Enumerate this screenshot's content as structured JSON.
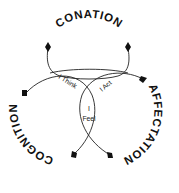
{
  "diagram": {
    "outer_labels": {
      "top": "CONATION",
      "right": "AFFECTATION",
      "left": "COGNITION"
    },
    "intersections": {
      "left_top": "I Think",
      "right_top": "I Act",
      "bottom_line1": "I",
      "bottom_line2": "Feel"
    },
    "colors": {
      "stroke": "#222222",
      "text": "#111111",
      "background": "#ffffff"
    }
  }
}
